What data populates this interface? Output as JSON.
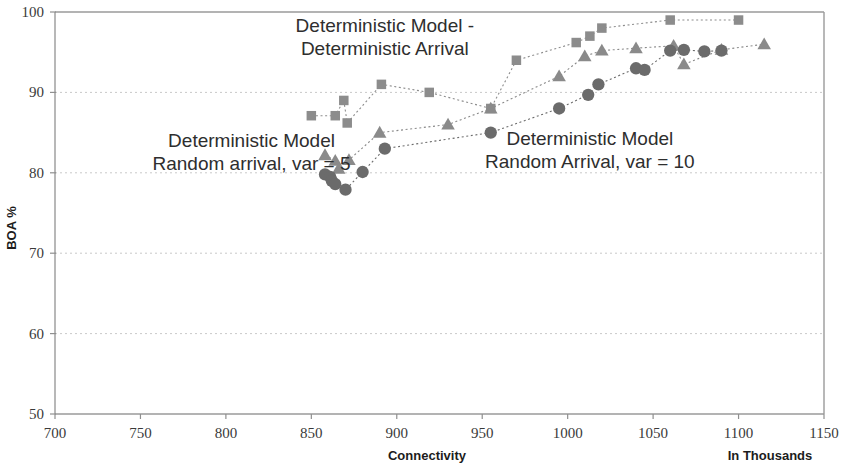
{
  "chart_data": {
    "type": "scatter",
    "title": "",
    "xlabel": "Connectivity",
    "xlabel_secondary": "In Thousands",
    "ylabel": "BOA %",
    "xlim": [
      700,
      1150
    ],
    "ylim": [
      50,
      100
    ],
    "xticks": [
      700,
      750,
      800,
      850,
      900,
      950,
      1000,
      1050,
      1100,
      1150
    ],
    "yticks": [
      50,
      60,
      70,
      80,
      90,
      100
    ],
    "grid": true,
    "grid_axis": "y",
    "legend": "none",
    "annotations": [
      {
        "name": "deterministic-arrival-label",
        "lines": [
          "Deterministic Model -",
          "Deterministic Arrival"
        ],
        "x": 893,
        "y": 97.5
      },
      {
        "name": "random-var5-label",
        "lines": [
          "Deterministic Model",
          "Random arrival, var = 5"
        ],
        "x": 815,
        "y": 83.2
      },
      {
        "name": "random-var10-label",
        "lines": [
          "Deterministic Model",
          "Random Arrival, var = 10"
        ],
        "x": 1013,
        "y": 83.4
      }
    ],
    "series": [
      {
        "name": "Deterministic Model - Deterministic Arrival",
        "marker": "square",
        "color": "#8c8c8c",
        "points": [
          [
            850,
            87.1
          ],
          [
            864,
            87.1
          ],
          [
            869,
            89.0
          ],
          [
            871,
            86.2
          ],
          [
            891,
            91.0
          ],
          [
            919,
            90.0
          ],
          [
            955,
            88.0
          ],
          [
            970,
            94.0
          ],
          [
            1005,
            96.2
          ],
          [
            1013,
            97.0
          ],
          [
            1020,
            98.0
          ],
          [
            1060,
            99.0
          ],
          [
            1100,
            99.0
          ]
        ]
      },
      {
        "name": "Deterministic Model Random arrival, var = 5",
        "marker": "triangle",
        "color": "#8a8a8a",
        "points": [
          [
            858,
            82.2
          ],
          [
            864,
            81.5
          ],
          [
            866,
            80.5
          ],
          [
            872,
            81.6
          ],
          [
            890,
            85.0
          ],
          [
            930,
            86.0
          ],
          [
            955,
            88.0
          ],
          [
            995,
            92.0
          ],
          [
            1010,
            94.5
          ],
          [
            1020,
            95.2
          ],
          [
            1040,
            95.5
          ],
          [
            1062,
            95.8
          ],
          [
            1068,
            93.5
          ],
          [
            1090,
            95.3
          ],
          [
            1115,
            96.0
          ]
        ]
      },
      {
        "name": "Deterministic Model Random Arrival, var = 10",
        "marker": "circle",
        "color": "#6b6b6b",
        "points": [
          [
            858,
            79.8
          ],
          [
            861,
            79.5
          ],
          [
            862,
            79.0
          ],
          [
            864,
            78.6
          ],
          [
            870,
            77.9
          ],
          [
            880,
            80.1
          ],
          [
            893,
            83.0
          ],
          [
            955,
            85.0
          ],
          [
            995,
            88.0
          ],
          [
            1012,
            89.7
          ],
          [
            1018,
            91.0
          ],
          [
            1040,
            93.0
          ],
          [
            1045,
            92.8
          ],
          [
            1060,
            95.2
          ],
          [
            1068,
            95.3
          ],
          [
            1080,
            95.1
          ],
          [
            1090,
            95.2
          ]
        ]
      }
    ]
  },
  "axes": {
    "y_title": "BOA %",
    "x_title": "Connectivity",
    "x_title_secondary": "In Thousands",
    "x_tick_labels": [
      "700",
      "750",
      "800",
      "850",
      "900",
      "950",
      "1000",
      "1050",
      "1100",
      "1150"
    ],
    "y_tick_labels": [
      "50",
      "60",
      "70",
      "80",
      "90",
      "100"
    ]
  }
}
